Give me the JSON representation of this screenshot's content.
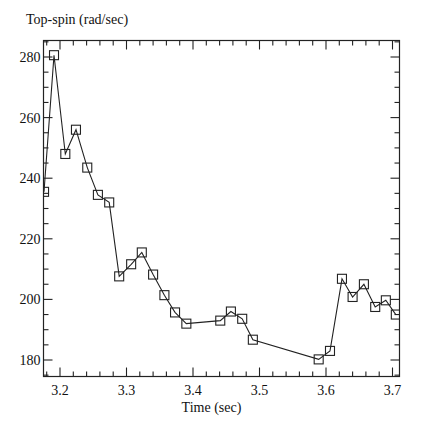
{
  "chart_data": {
    "type": "line",
    "title": "",
    "ylabel": "Top-spin (rad/sec)",
    "xlabel": "Time (sec)",
    "xlim": [
      3.176,
      3.712
    ],
    "ylim": [
      174.5,
      285.5
    ],
    "x_ticks": [
      3.2,
      3.3,
      3.4,
      3.5,
      3.6,
      3.7
    ],
    "x_tick_labels": [
      "3.2",
      "3.3",
      "3.4",
      "3.5",
      "3.6",
      "3.7"
    ],
    "y_ticks": [
      180,
      200,
      220,
      240,
      260,
      280
    ],
    "y_tick_labels": [
      "180",
      "200",
      "220",
      "240",
      "260",
      "280"
    ],
    "grid": false,
    "legend": null,
    "marker": "open-square",
    "series": [
      {
        "name": "Top-spin",
        "x": [
          3.176,
          3.191,
          3.208,
          3.224,
          3.241,
          3.257,
          3.274,
          3.289,
          3.307,
          3.323,
          3.34,
          3.357,
          3.373,
          3.39,
          3.441,
          3.457,
          3.474,
          3.49,
          3.589,
          3.606,
          3.624,
          3.64,
          3.657,
          3.674,
          3.69,
          3.705
        ],
        "values": [
          235.5,
          280.6,
          248.0,
          256.0,
          243.5,
          234.5,
          232.0,
          207.6,
          211.6,
          215.5,
          208.2,
          201.4,
          195.7,
          192.0,
          193.0,
          196.0,
          193.6,
          186.7,
          180.2,
          183.0,
          206.8,
          200.8,
          205.0,
          197.5,
          199.7,
          195.0
        ]
      }
    ]
  },
  "labels": {
    "ylabel": "Top-spin (rad/sec)",
    "xlabel": "Time (sec)"
  }
}
